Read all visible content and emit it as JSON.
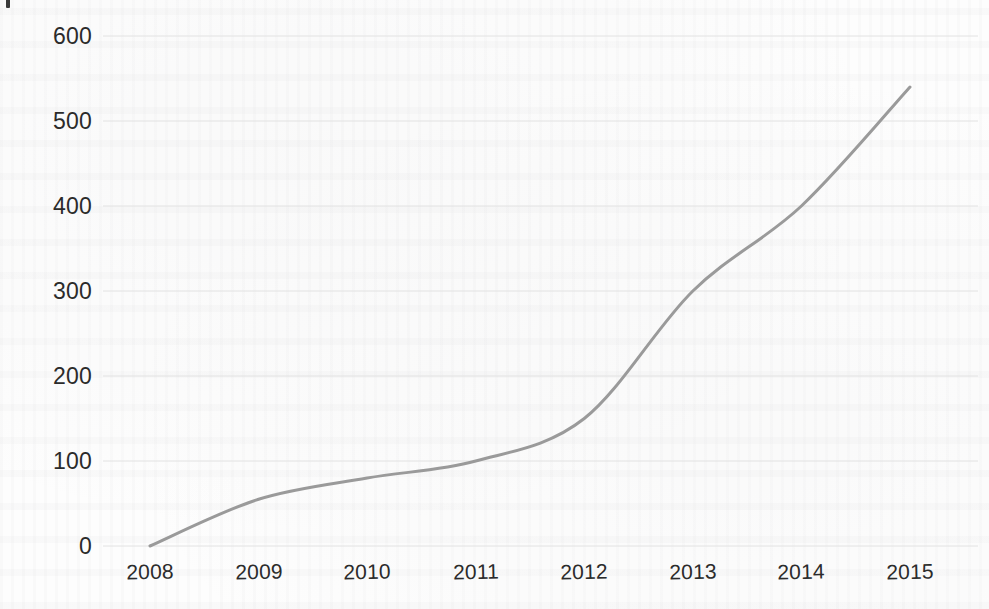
{
  "chart_data": {
    "type": "line",
    "title": "",
    "subtitle": "",
    "xlabel": "",
    "ylabel": "",
    "categories": [
      "2008",
      "2009",
      "2010",
      "2011",
      "2012",
      "2013",
      "2014",
      "2015"
    ],
    "x": [
      2008,
      2009,
      2010,
      2011,
      2012,
      2013,
      2014,
      2015
    ],
    "values": [
      0,
      55,
      80,
      100,
      150,
      300,
      400,
      540
    ],
    "series": [
      {
        "name": "",
        "values": [
          0,
          55,
          80,
          100,
          150,
          300,
          400,
          540
        ],
        "color": "#9a9a9a",
        "line_width": 3,
        "smooth": true,
        "markers": false
      }
    ],
    "ylim": [
      0,
      600
    ],
    "yticks": [
      0,
      100,
      200,
      300,
      400,
      500,
      600
    ],
    "ytick_labels": [
      "0",
      "100",
      "200",
      "300",
      "400",
      "500",
      "600"
    ],
    "xtick_labels": [
      "2008",
      "2009",
      "2010",
      "2011",
      "2012",
      "2013",
      "2014",
      "2015"
    ],
    "grid": true,
    "grid_axis": "y",
    "grid_color": "#e2e2e2",
    "legend": false,
    "legend_position": "none",
    "background": "#fdfdfd",
    "annotations": []
  },
  "colors": {
    "line": "#9a9a9a",
    "grid": "#e2e2e2",
    "text": "#2b2b2b",
    "background": "#fdfdfd"
  }
}
